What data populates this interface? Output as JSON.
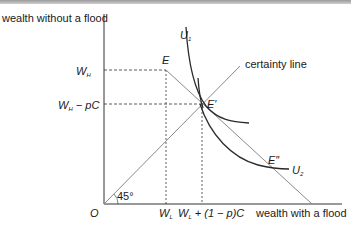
{
  "diagram": {
    "y_axis_label": "wealth without a flood",
    "x_axis_label": "wealth with a flood",
    "origin_label": "O",
    "angle_label": "45°",
    "certainty_line_label": "certainty line",
    "y_ticks": {
      "wh": {
        "main": "W",
        "sub": "H"
      },
      "wh_minus_pc": {
        "main": "W",
        "sub": "H",
        "suffix": " − pC"
      }
    },
    "x_ticks": {
      "wl": {
        "main": "W",
        "sub": "L"
      },
      "wl_plus": {
        "main": "W",
        "sub": "L",
        "suffix": " + (1 − p)C"
      }
    },
    "points": {
      "e": "E",
      "e_prime": "E′",
      "e_double_prime": "E″"
    },
    "curves": {
      "u1": {
        "main": "U",
        "sub": "1"
      },
      "u2": {
        "main": "U",
        "sub": "2"
      }
    },
    "colors": {
      "axis": "#333333",
      "curve": "#2a2a2a",
      "line": "#8a8a8a",
      "dashed": "#333333"
    }
  }
}
